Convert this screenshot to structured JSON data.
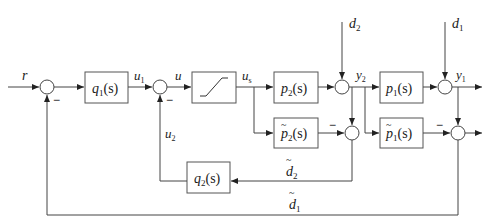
{
  "diagram": {
    "type": "control-block-diagram",
    "signals": {
      "reference": "r",
      "u1": "u",
      "u1_sub": "1",
      "u": "u",
      "us": "u",
      "us_sub": "s",
      "u2": "u",
      "u2_sub": "2",
      "y2": "y",
      "y2_sub": "2",
      "y1": "y",
      "y1_sub": "1",
      "d2": "d",
      "d2_sub": "2",
      "d1": "d",
      "d1_sub": "1",
      "d2_est": "d",
      "d2_est_sub": "2",
      "d1_est": "d",
      "d1_est_sub": "1"
    },
    "blocks": {
      "q1": {
        "name": "q",
        "sub": "1",
        "arg": "(s)"
      },
      "saturation": {
        "name": "saturation"
      },
      "p2": {
        "name": "p",
        "sub": "2",
        "arg": "(s)"
      },
      "p1": {
        "name": "p",
        "sub": "1",
        "arg": "(s)"
      },
      "p2_model": {
        "name": "p",
        "sub": "2",
        "arg": "(s)",
        "tilde": "~"
      },
      "p1_model": {
        "name": "p",
        "sub": "1",
        "arg": "(s)",
        "tilde": "~"
      },
      "q2": {
        "name": "q",
        "sub": "2",
        "arg": "(s)"
      }
    },
    "minus_sign": "−",
    "tilde": "~"
  }
}
